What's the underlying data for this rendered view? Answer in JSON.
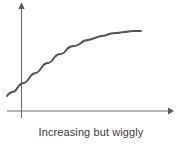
{
  "figure": {
    "caption": "Increasing but wiggly",
    "caption_color": "#3b3b3b",
    "background_color": "#ffffff"
  },
  "axes": {
    "axis_color": "#6b6b6b",
    "x_axis_name": "x-axis",
    "y_axis_name": "y-axis",
    "x_axis_arrow": "arrow-right",
    "y_axis_arrow": "arrow-up",
    "x_tick_labels": [],
    "y_tick_labels": [],
    "grid": false
  },
  "chart_data": {
    "type": "line",
    "title": "Increasing but wiggly",
    "subtitle": "",
    "xlabel": "",
    "ylabel": "",
    "grid": false,
    "legend": [],
    "legend_position": "none",
    "xlim": [
      0,
      10
    ],
    "ylim": [
      0,
      10
    ],
    "xticks": [],
    "yticks": [],
    "annotations": [
      "Increasing but wiggly"
    ],
    "series": [
      {
        "name": "increasing-wiggly-curve",
        "color": "#565656",
        "line_width": 2,
        "description": "Monotonically increasing concave curve with small periodic wiggles superimposed; rises steeply at left, flattens toward the right.",
        "x": [
          -1.05,
          -0.85,
          -0.65,
          -0.45,
          -0.25,
          -0.05,
          0.15,
          0.35,
          0.55,
          0.75,
          0.95,
          1.15,
          1.35,
          1.55,
          1.75,
          1.95,
          2.15,
          2.35,
          2.55,
          2.75,
          2.95,
          3.15,
          3.35,
          3.55,
          3.75,
          3.95,
          4.15,
          4.35,
          4.55,
          4.75,
          4.95,
          5.15,
          5.35,
          5.55,
          5.75,
          5.95,
          6.15,
          6.35,
          6.55,
          6.75,
          6.95,
          7.15,
          7.35,
          7.55,
          7.75,
          7.95,
          8.15,
          8.35,
          8.55,
          8.75,
          8.95
        ],
        "y": [
          1.12,
          1.3,
          1.38,
          1.42,
          1.58,
          1.82,
          1.97,
          2.03,
          2.12,
          2.33,
          2.58,
          2.74,
          2.81,
          2.93,
          3.14,
          3.37,
          3.51,
          3.59,
          3.73,
          3.94,
          4.14,
          4.27,
          4.37,
          4.52,
          4.7,
          4.86,
          4.96,
          5.07,
          5.22,
          5.38,
          5.49,
          5.59,
          5.72,
          5.86,
          5.97,
          6.06,
          6.18,
          6.31,
          6.4,
          6.48,
          6.59,
          6.7,
          6.78,
          6.85,
          6.94,
          7.03,
          7.09,
          7.14,
          7.2,
          7.26,
          7.3
        ],
        "pixel_path": "M7,96 C9,93 11,92 13,92 C15,92 16,90 18,87 C20,84 22,83 24,83 C26,83 28,80 30,77 C32,74 34,73 36,73 C38,73 40,70 42,67 C44,64 46,63 48,63 C50,63 52,61 54,58 C56,55 58,54 61,54 C63,54 65,52 67,49 C69,47 71,46 74,46 C76,46 78,45 81,43 C83,41 85,40 88,40 C90,40 92,39 95,38 C97,37 99,36 102,36 C104,36 107,35 109,34 C112,33 114,33 117,33 C119,33 122,32 124,32 C127,32 130,31 133,31 C136,31 139,31 141,31"
      }
    ]
  }
}
